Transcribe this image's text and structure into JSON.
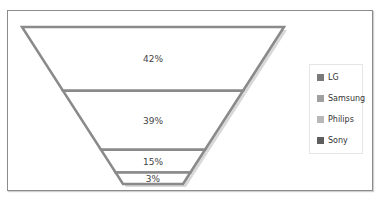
{
  "chart_data": {
    "type": "funnel",
    "title": "",
    "categories": [
      "LG",
      "Samsung",
      "Philips",
      "Sony"
    ],
    "values": [
      42,
      39,
      15,
      3
    ],
    "value_labels": [
      "42%",
      "39%",
      "15%",
      "3%"
    ],
    "legend": {
      "position": "right",
      "entries": [
        {
          "label": "LG",
          "color": "#7a7a7a"
        },
        {
          "label": "Samsung",
          "color": "#a0a0a0"
        },
        {
          "label": "Philips",
          "color": "#b8b8b8"
        },
        {
          "label": "Sony",
          "color": "#5e5e5e"
        }
      ]
    }
  }
}
